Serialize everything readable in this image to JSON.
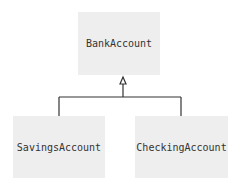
{
  "diagram": {
    "type": "uml-inheritance",
    "parent": {
      "label": "BankAccount"
    },
    "children": [
      {
        "label": "SavingsAccount"
      },
      {
        "label": "CheckingAccount"
      }
    ],
    "colors": {
      "box_fill": "#eeeeee",
      "line": "#333333",
      "text": "#333333"
    }
  }
}
